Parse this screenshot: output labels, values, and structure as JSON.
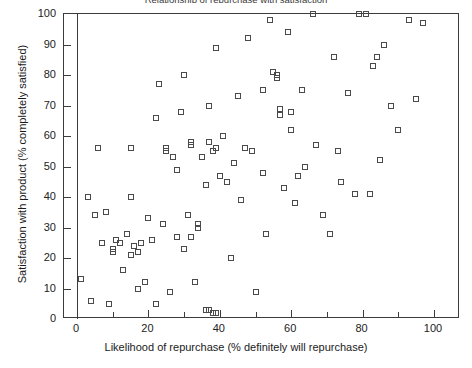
{
  "chart_data": {
    "type": "scatter",
    "title": "Relationship of repurchase with satisfaction",
    "xlabel": "Likelihood of repurchase (% definitely will repurchase)",
    "ylabel": "Satisfaction with product (% completely satisfied)",
    "xlim": [
      0,
      107
    ],
    "ylim": [
      0,
      100
    ],
    "grid": false,
    "legend": null,
    "marker": "open-square",
    "marker_color": "#4a4a4a",
    "axis_color": "#3c3c3c",
    "background": "#ffffff",
    "xticks": [
      0,
      20,
      40,
      60,
      80,
      100
    ],
    "xticks_minor": [
      10,
      30,
      50,
      70,
      90
    ],
    "yticks": [
      0,
      10,
      20,
      30,
      40,
      50,
      60,
      70,
      80,
      90,
      100
    ],
    "xtick_labels": [
      "0",
      "20",
      "40",
      "60",
      "80",
      "100"
    ],
    "ytick_labels": [
      "0",
      "10",
      "20",
      "30",
      "40",
      "50",
      "60",
      "70",
      "80",
      "90",
      "100"
    ],
    "points": [
      [
        1,
        13
      ],
      [
        3,
        40
      ],
      [
        4,
        6
      ],
      [
        5,
        34
      ],
      [
        6,
        56
      ],
      [
        7,
        25
      ],
      [
        8,
        35
      ],
      [
        9,
        5
      ],
      [
        10,
        23
      ],
      [
        10,
        22
      ],
      [
        11,
        26
      ],
      [
        12,
        25
      ],
      [
        13,
        16
      ],
      [
        14,
        28
      ],
      [
        15,
        21
      ],
      [
        15,
        40
      ],
      [
        15,
        56
      ],
      [
        16,
        24
      ],
      [
        17,
        10
      ],
      [
        17,
        22
      ],
      [
        18,
        25
      ],
      [
        19,
        12
      ],
      [
        20,
        33
      ],
      [
        21,
        26
      ],
      [
        22,
        5
      ],
      [
        22,
        66
      ],
      [
        23,
        77
      ],
      [
        24,
        31
      ],
      [
        25,
        55
      ],
      [
        25,
        56
      ],
      [
        26,
        9
      ],
      [
        27,
        53
      ],
      [
        28,
        27
      ],
      [
        28,
        49
      ],
      [
        29,
        68
      ],
      [
        30,
        23
      ],
      [
        30,
        80
      ],
      [
        31,
        34
      ],
      [
        32,
        27
      ],
      [
        32,
        58
      ],
      [
        32,
        57
      ],
      [
        33,
        12
      ],
      [
        34,
        30
      ],
      [
        34,
        31
      ],
      [
        35,
        53
      ],
      [
        36,
        3
      ],
      [
        36,
        44
      ],
      [
        37,
        3
      ],
      [
        37,
        58
      ],
      [
        37,
        70
      ],
      [
        38,
        2
      ],
      [
        38,
        2
      ],
      [
        38,
        55
      ],
      [
        39,
        2
      ],
      [
        39,
        56
      ],
      [
        39,
        89
      ],
      [
        40,
        47
      ],
      [
        41,
        60
      ],
      [
        42,
        45
      ],
      [
        43,
        20
      ],
      [
        44,
        51
      ],
      [
        45,
        73
      ],
      [
        46,
        39
      ],
      [
        47,
        56
      ],
      [
        48,
        92
      ],
      [
        49,
        55
      ],
      [
        50,
        9
      ],
      [
        52,
        48
      ],
      [
        52,
        75
      ],
      [
        53,
        28
      ],
      [
        54,
        98
      ],
      [
        55,
        81
      ],
      [
        56,
        79
      ],
      [
        56,
        80
      ],
      [
        57,
        67
      ],
      [
        57,
        69
      ],
      [
        58,
        43
      ],
      [
        59,
        94
      ],
      [
        60,
        62
      ],
      [
        60,
        68
      ],
      [
        61,
        38
      ],
      [
        62,
        47
      ],
      [
        63,
        75
      ],
      [
        64,
        50
      ],
      [
        66,
        100
      ],
      [
        67,
        57
      ],
      [
        69,
        34
      ],
      [
        71,
        28
      ],
      [
        72,
        86
      ],
      [
        73,
        55
      ],
      [
        74,
        45
      ],
      [
        76,
        74
      ],
      [
        78,
        41
      ],
      [
        79,
        100
      ],
      [
        81,
        100
      ],
      [
        82,
        41
      ],
      [
        83,
        83
      ],
      [
        84,
        86
      ],
      [
        85,
        52
      ],
      [
        86,
        90
      ],
      [
        88,
        70
      ],
      [
        90,
        62
      ],
      [
        93,
        98
      ],
      [
        95,
        72
      ],
      [
        97,
        97
      ]
    ]
  }
}
